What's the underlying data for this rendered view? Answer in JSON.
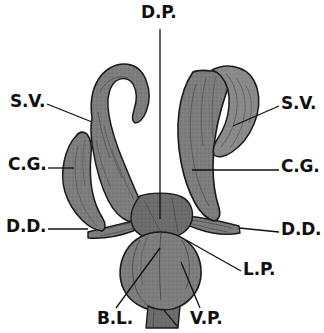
{
  "figure": {
    "type": "anatomical-line-drawing",
    "background_color": "#ffffff",
    "organ_fill_color": "#7d7d7d",
    "organ_fill_light": "#949494",
    "organ_fill_dark": "#6a6a6a",
    "outline_color": "#1a1a1a",
    "leader_line_color": "#111111",
    "label_text_color": "#111111"
  },
  "labels": [
    {
      "id": "dorsal-penis",
      "text": "D.P.",
      "x": 141,
      "y": 4,
      "leader": {
        "type": "line",
        "x1": 160,
        "y1": 29,
        "x2": 160,
        "y2": 219
      }
    },
    {
      "id": "seminal-vesicle-left",
      "text": "S.V.",
      "x": 10,
      "y": 93,
      "leader": {
        "type": "line",
        "x1": 47,
        "y1": 104,
        "x2": 92,
        "y2": 122
      }
    },
    {
      "id": "seminal-vesicle-right",
      "text": "S.V.",
      "x": 281,
      "y": 95,
      "leader": {
        "type": "line",
        "x1": 279,
        "y1": 106,
        "x2": 233,
        "y2": 126
      }
    },
    {
      "id": "cement-gland-left",
      "text": "C.G.",
      "x": 8,
      "y": 156,
      "leader": {
        "type": "line",
        "x1": 48,
        "y1": 168,
        "x2": 74,
        "y2": 168
      }
    },
    {
      "id": "cement-gland-right",
      "text": "C.G.",
      "x": 281,
      "y": 158,
      "leader": {
        "type": "line",
        "x1": 279,
        "y1": 170,
        "x2": 192,
        "y2": 170
      }
    },
    {
      "id": "deferent-duct-left",
      "text": "D.D.",
      "x": 6,
      "y": 218,
      "leader": {
        "type": "line",
        "x1": 48,
        "y1": 229,
        "x2": 88,
        "y2": 229
      }
    },
    {
      "id": "deferent-duct-right",
      "text": "D.D.",
      "x": 281,
      "y": 221,
      "leader": {
        "type": "line",
        "x1": 279,
        "y1": 232,
        "x2": 239,
        "y2": 228
      }
    },
    {
      "id": "lateral-penis",
      "text": "L.P.",
      "x": 243,
      "y": 261,
      "leader": {
        "type": "line",
        "x1": 241,
        "y1": 271,
        "x2": 186,
        "y2": 240
      }
    },
    {
      "id": "bursa-lobe",
      "text": "B.L.",
      "x": 97,
      "y": 310,
      "leader": {
        "type": "line",
        "x1": 116,
        "y1": 308,
        "x2": 160,
        "y2": 248
      }
    },
    {
      "id": "ventral-penis",
      "text": "V.P.",
      "x": 190,
      "y": 310,
      "leader": {
        "type": "line",
        "x1": 200,
        "y1": 308,
        "x2": 181,
        "y2": 262
      }
    }
  ],
  "structures": [
    {
      "id": "seminal-vesicle-left-body",
      "name": "left seminal vesicle"
    },
    {
      "id": "seminal-vesicle-right-body",
      "name": "right seminal vesicle"
    },
    {
      "id": "cement-gland-left-body",
      "name": "left cement gland"
    },
    {
      "id": "cement-gland-right-body",
      "name": "right cement gland"
    },
    {
      "id": "deferent-duct-left-body",
      "name": "left deferent duct"
    },
    {
      "id": "deferent-duct-right-body",
      "name": "right deferent duct"
    },
    {
      "id": "bursa-body",
      "name": "bursa / copulatory bulb"
    },
    {
      "id": "stalk-body",
      "name": "terminal stalk"
    }
  ]
}
